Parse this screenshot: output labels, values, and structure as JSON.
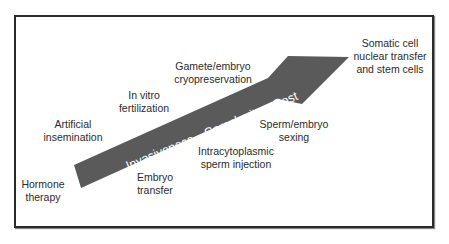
{
  "diagram": {
    "arrow": {
      "text": "Invasiveness—Complexity—Cost",
      "fill_color": "#5a5a5a",
      "text_color": "#ffffff"
    },
    "techniques": [
      {
        "line1": "Hormone",
        "line2": "therapy"
      },
      {
        "line1": "Artificial",
        "line2": "insemination"
      },
      {
        "line1": "In vitro",
        "line2": "fertilization"
      },
      {
        "line1": "Gamete/embryo",
        "line2": "cryopreservation"
      },
      {
        "line1": "Embryo",
        "line2": "transfer"
      },
      {
        "line1": "Intracytoplasmic",
        "line2": "sperm injection"
      },
      {
        "line1": "Sperm/embryo",
        "line2": "sexing"
      },
      {
        "line1": "Somatic cell",
        "line2": "nuclear transfer",
        "line3": "and stem cells"
      }
    ]
  }
}
